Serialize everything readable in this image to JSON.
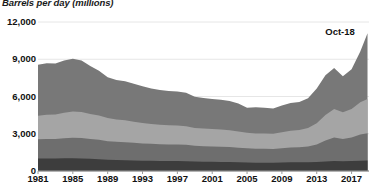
{
  "chart_data": {
    "type": "area",
    "title": "Barrels per day (millions)",
    "subtitle": "",
    "xlabel": "",
    "ylabel": "Barrels per day (millions)",
    "ylim": [
      0,
      12000
    ],
    "xlim": [
      1981,
      2019
    ],
    "grid": true,
    "legend": "none",
    "stacked": true,
    "annotations": [
      {
        "label": "Oct-18",
        "x": 2018.8,
        "y": 11200
      }
    ],
    "ytick_labels": [
      "0",
      "3,000",
      "6,000",
      "9,000",
      "12,000"
    ],
    "ytick_values": [
      0,
      3000,
      6000,
      9000,
      12000
    ],
    "xtick_labels": [
      "1981",
      "1985",
      "1989",
      "1993",
      "1997",
      "2001",
      "2005",
      "2009",
      "2013",
      "2017"
    ],
    "xtick_values": [
      1981,
      1985,
      1989,
      1993,
      1997,
      2001,
      2005,
      2009,
      2013,
      2017
    ],
    "colors": {
      "band1": "#3d3d3d",
      "band2": "#6e6e6e",
      "band3": "#a5a5a5",
      "band4": "#787878",
      "grid": "#e6e6e6",
      "axis": "#9a9a9a",
      "text": "#111111"
    },
    "x": [
      1981,
      1982,
      1983,
      1984,
      1985,
      1986,
      1987,
      1988,
      1989,
      1990,
      1991,
      1992,
      1993,
      1994,
      1995,
      1996,
      1997,
      1998,
      1999,
      2000,
      2001,
      2002,
      2003,
      2004,
      2005,
      2006,
      2007,
      2008,
      2009,
      2010,
      2011,
      2012,
      2013,
      2014,
      2015,
      2016,
      2017,
      2018,
      2018.83
    ],
    "series": [
      {
        "name": "band1-bottom",
        "color": "#3d3d3d",
        "values": [
          1000,
          1010,
          1000,
          1020,
          1030,
          1010,
          980,
          950,
          900,
          880,
          870,
          850,
          830,
          820,
          810,
          800,
          800,
          790,
          760,
          750,
          740,
          730,
          720,
          700,
          680,
          670,
          670,
          660,
          680,
          700,
          700,
          700,
          720,
          760,
          800,
          780,
          800,
          830,
          840
        ]
      },
      {
        "name": "band2",
        "color": "#6e6e6e",
        "values": [
          1550,
          1570,
          1580,
          1620,
          1650,
          1640,
          1600,
          1560,
          1500,
          1470,
          1450,
          1420,
          1390,
          1370,
          1350,
          1340,
          1340,
          1320,
          1270,
          1250,
          1240,
          1230,
          1210,
          1180,
          1150,
          1130,
          1130,
          1120,
          1160,
          1200,
          1220,
          1280,
          1420,
          1700,
          1900,
          1800,
          1900,
          2100,
          2200
        ]
      },
      {
        "name": "band3",
        "color": "#a5a5a5",
        "values": [
          1900,
          1950,
          1980,
          2050,
          2120,
          2100,
          2020,
          1960,
          1860,
          1800,
          1760,
          1700,
          1650,
          1600,
          1560,
          1540,
          1530,
          1500,
          1440,
          1420,
          1400,
          1380,
          1350,
          1300,
          1260,
          1230,
          1230,
          1220,
          1280,
          1340,
          1380,
          1480,
          1700,
          2050,
          2300,
          2150,
          2300,
          2600,
          2750
        ]
      },
      {
        "name": "band4-top",
        "color": "#787878",
        "values": [
          4100,
          4150,
          4100,
          4200,
          4250,
          4150,
          3850,
          3600,
          3300,
          3180,
          3150,
          3050,
          2950,
          2860,
          2800,
          2760,
          2740,
          2690,
          2500,
          2460,
          2420,
          2400,
          2350,
          2250,
          2000,
          2100,
          2060,
          2030,
          2150,
          2240,
          2260,
          2400,
          2800,
          3200,
          3300,
          2900,
          3200,
          4100,
          5300
        ]
      }
    ]
  }
}
